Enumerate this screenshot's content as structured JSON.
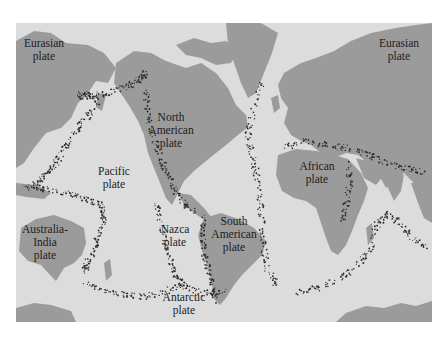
{
  "map": {
    "title": "",
    "colors": {
      "ocean": "#dcdcdc",
      "land": "#9b9b9b",
      "quake": "#2a2a2a",
      "frame": "#ffffff",
      "label": "#1c1c1c"
    },
    "labels": [
      {
        "id": "eurasian-west",
        "text": "Eurasian\nplate",
        "x": 28,
        "y": 37
      },
      {
        "id": "eurasian-east",
        "text": "Eurasian\nplate",
        "x": 399,
        "y": 37
      },
      {
        "id": "north-american",
        "text": "North\nAmerican\nplate",
        "x": 171,
        "y": 111
      },
      {
        "id": "pacific",
        "text": "Pacific\nplate",
        "x": 114,
        "y": 165
      },
      {
        "id": "african",
        "text": "African\nplate",
        "x": 317,
        "y": 160
      },
      {
        "id": "australia-india",
        "text": "Australia-\nIndia\nplate",
        "x": 45,
        "y": 223
      },
      {
        "id": "nazca",
        "text": "Nazca\nplate",
        "x": 175,
        "y": 223
      },
      {
        "id": "south-american",
        "text": "South\nAmerican\nplate",
        "x": 234,
        "y": 215
      },
      {
        "id": "antarctic",
        "text": "Antarctic\nplate",
        "x": 184,
        "y": 291
      }
    ]
  }
}
